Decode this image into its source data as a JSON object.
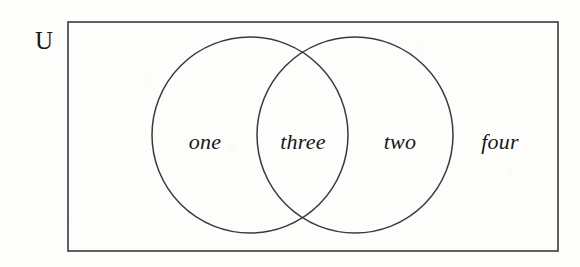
{
  "figure": {
    "type": "venn-diagram",
    "background_color": "#fdfdfb",
    "stroke_color": "#3a3a3a",
    "text_color": "#171717"
  },
  "universe": {
    "label": "U",
    "rect": {
      "x": 68,
      "y": 22,
      "width": 490,
      "height": 229
    }
  },
  "sets": [
    {
      "name": "left-set",
      "cx": 250,
      "cy": 135,
      "r": 98
    },
    {
      "name": "right-set",
      "cx": 355,
      "cy": 135,
      "r": 98
    }
  ],
  "regions": [
    {
      "key": "left_only",
      "label": "one",
      "x": 205,
      "y": 142
    },
    {
      "key": "intersection",
      "label": "three",
      "x": 303,
      "y": 142
    },
    {
      "key": "right_only",
      "label": "two",
      "x": 400,
      "y": 142
    },
    {
      "key": "outside",
      "label": "four",
      "x": 500,
      "y": 142
    }
  ]
}
